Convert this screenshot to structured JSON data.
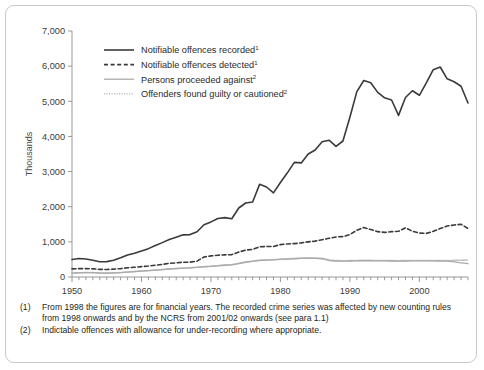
{
  "chart_data": {
    "type": "line",
    "title": "",
    "xlabel": "",
    "ylabel": "Thousands",
    "xlim": [
      1950,
      2007
    ],
    "ylim": [
      0,
      7000
    ],
    "ytick_labels": [
      "0",
      "1,000",
      "2,000",
      "3,000",
      "4,000",
      "5,000",
      "6,000",
      "7,000"
    ],
    "ytick_values": [
      0,
      1000,
      2000,
      3000,
      4000,
      5000,
      6000,
      7000
    ],
    "xtick_labels": [
      "1950",
      "1960",
      "1970",
      "1980",
      "1990",
      "2000"
    ],
    "xtick_values": [
      1950,
      1960,
      1970,
      1980,
      1990,
      2000
    ],
    "minor_xticks": "every year 1950-2007",
    "grid": false,
    "legend_position": "upper left inside",
    "x": [
      1950,
      1951,
      1952,
      1953,
      1954,
      1955,
      1956,
      1957,
      1958,
      1959,
      1960,
      1961,
      1962,
      1963,
      1964,
      1965,
      1966,
      1967,
      1968,
      1969,
      1970,
      1971,
      1972,
      1973,
      1974,
      1975,
      1976,
      1977,
      1978,
      1979,
      1980,
      1981,
      1982,
      1983,
      1984,
      1985,
      1986,
      1987,
      1988,
      1989,
      1990,
      1991,
      1992,
      1993,
      1994,
      1995,
      1996,
      1997,
      1998,
      1999,
      2000,
      2001,
      2002,
      2003,
      2004,
      2005,
      2006,
      2007
    ],
    "series": [
      {
        "name": "Notifiable offences recorded",
        "footnote": "1",
        "style": "solid",
        "color": "#3a3a3a",
        "width": 1.6,
        "values": [
          500,
          525,
          513,
          477,
          436,
          438,
          479,
          546,
          626,
          675,
          743,
          807,
          896,
          978,
          1067,
          1133,
          1199,
          1207,
          1289,
          1488,
          1568,
          1666,
          1690,
          1658,
          1963,
          2106,
          2136,
          2636,
          2561,
          2395,
          2688,
          2964,
          3262,
          3247,
          3499,
          3612,
          3847,
          3892,
          3716,
          3870,
          4544,
          5276,
          5592,
          5527,
          5253,
          5100,
          5036,
          4598,
          5109,
          5301,
          5171,
          5525,
          5899,
          5975,
          5638,
          5556,
          5428,
          4951
        ]
      },
      {
        "name": "Notifiable offences detected",
        "footnote": "1",
        "style": "dashed",
        "color": "#3a3a3a",
        "width": 1.6,
        "values": [
          232,
          238,
          240,
          232,
          217,
          213,
          225,
          239,
          262,
          277,
          295,
          311,
          334,
          358,
          388,
          402,
          421,
          421,
          450,
          570,
          600,
          619,
          630,
          638,
          708,
          767,
          786,
          860,
          866,
          870,
          922,
          940,
          950,
          970,
          1000,
          1020,
          1060,
          1100,
          1140,
          1150,
          1210,
          1330,
          1410,
          1350,
          1290,
          1270,
          1290,
          1300,
          1400,
          1300,
          1250,
          1240,
          1300,
          1380,
          1450,
          1480,
          1500,
          1380
        ]
      },
      {
        "name": "Persons proceeded against",
        "footnote": "2",
        "style": "solid",
        "color": "#aaaaaa",
        "width": 1.3,
        "values": [
          110,
          118,
          125,
          122,
          112,
          108,
          115,
          125,
          140,
          155,
          168,
          180,
          195,
          210,
          228,
          240,
          252,
          258,
          272,
          290,
          300,
          318,
          335,
          345,
          380,
          420,
          445,
          470,
          480,
          485,
          500,
          510,
          520,
          528,
          535,
          532,
          520,
          470,
          455,
          450,
          455,
          460,
          465,
          462,
          460,
          458,
          455,
          452,
          455,
          458,
          460,
          458,
          456,
          455,
          450,
          430,
          405,
          382
        ]
      },
      {
        "name": "Offenders found guilty or cautioned",
        "footnote": "2",
        "style": "dotted",
        "color": "#bdbdbd",
        "width": 1.6,
        "values": [
          112,
          120,
          127,
          124,
          114,
          110,
          117,
          127,
          142,
          157,
          170,
          182,
          197,
          212,
          230,
          243,
          255,
          262,
          276,
          295,
          308,
          325,
          342,
          352,
          388,
          428,
          452,
          478,
          488,
          494,
          508,
          518,
          528,
          536,
          543,
          540,
          530,
          482,
          468,
          462,
          466,
          470,
          474,
          472,
          470,
          468,
          466,
          464,
          466,
          468,
          470,
          468,
          466,
          466,
          470,
          472,
          478,
          482
        ]
      }
    ]
  },
  "legend": {
    "items": [
      {
        "label": "Notifiable offences recorded",
        "sup": "1"
      },
      {
        "label": "Notifiable offences detected",
        "sup": "1"
      },
      {
        "label": "Persons proceeded against",
        "sup": "2"
      },
      {
        "label": "Offenders found guilty or cautioned",
        "sup": "2"
      }
    ]
  },
  "notes": [
    {
      "num": "(1)",
      "text": "From 1998 the figures are for financial years. The recorded crime series was affected by new counting rules from 1998 onwards and by the NCRS from 2001/02 onwards (see para 1.1)"
    },
    {
      "num": "(2)",
      "text": "Indictable offences with allowance for under-recording where appropriate."
    }
  ]
}
